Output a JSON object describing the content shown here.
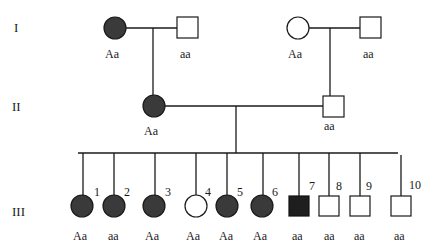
{
  "generations": {
    "I": "I",
    "II": "II",
    "III": "III"
  },
  "gen1": {
    "left_couple": {
      "female": {
        "sex": "female",
        "affected": true,
        "genotype": "Aa"
      },
      "male": {
        "sex": "male",
        "affected": false,
        "genotype": "aa"
      }
    },
    "right_couple": {
      "female": {
        "sex": "female",
        "affected": false,
        "genotype": "Aa"
      },
      "male": {
        "sex": "male",
        "affected": false,
        "genotype": "aa"
      }
    }
  },
  "gen2": {
    "female": {
      "sex": "female",
      "affected": true,
      "genotype": "Aa"
    },
    "male": {
      "sex": "male",
      "affected": false,
      "genotype": "aa"
    }
  },
  "gen3": {
    "children": [
      {
        "number": "1",
        "sex": "female",
        "affected": true,
        "genotype": "Aa"
      },
      {
        "number": "2",
        "sex": "female",
        "affected": true,
        "genotype": "aa"
      },
      {
        "number": "3",
        "sex": "female",
        "affected": true,
        "genotype": "Aa"
      },
      {
        "number": "4",
        "sex": "female",
        "affected": false,
        "genotype": "Aa"
      },
      {
        "number": "5",
        "sex": "female",
        "affected": true,
        "genotype": "Aa"
      },
      {
        "number": "6",
        "sex": "female",
        "affected": true,
        "genotype": "Aa"
      },
      {
        "number": "7",
        "sex": "male",
        "affected": true,
        "genotype": "aa"
      },
      {
        "number": "8",
        "sex": "male",
        "affected": false,
        "genotype": "aa"
      },
      {
        "number": "9",
        "sex": "male",
        "affected": false,
        "genotype": "aa"
      },
      {
        "number": "10",
        "sex": "male",
        "affected": false,
        "genotype": "aa"
      }
    ]
  },
  "colors": {
    "affected_fill": "#3a3a3a",
    "unaffected_fill": "#ffffff",
    "line": "#1a1a1a"
  }
}
